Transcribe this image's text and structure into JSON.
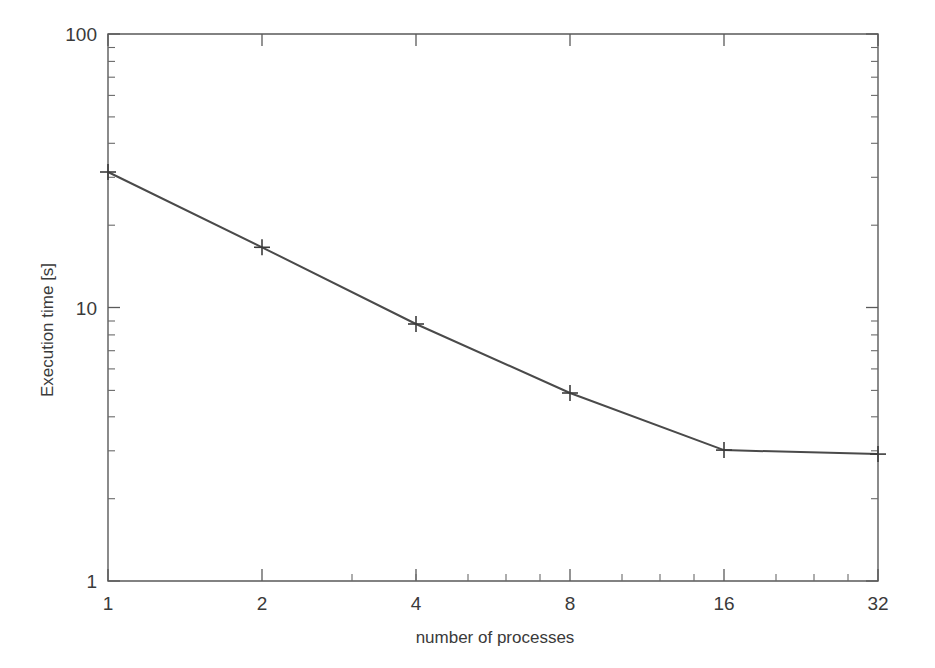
{
  "chart_data": {
    "type": "line",
    "title": "",
    "subtitle": "",
    "xlabel": "number of processes",
    "ylabel": "Execution time [s]",
    "xscale": "log2",
    "yscale": "log10",
    "xlim": [
      1,
      32
    ],
    "ylim": [
      1,
      100
    ],
    "grid": false,
    "legend": null,
    "x_tick_labels": [
      "1",
      "2",
      "4",
      "8",
      "16",
      "32"
    ],
    "x_ticks": [
      1,
      2,
      4,
      8,
      16,
      32
    ],
    "y_tick_labels": [
      "1",
      "10",
      "100"
    ],
    "y_ticks": [
      1,
      10,
      100
    ],
    "marker": "plus",
    "line_color": "#4a4a4a",
    "series": [
      {
        "name": "execution time",
        "x": [
          1,
          2,
          4,
          8,
          16,
          32
        ],
        "values": [
          31.3,
          16.6,
          8.7,
          4.87,
          3.01,
          2.91
        ]
      }
    ],
    "annotations": []
  },
  "axes": {
    "x_axis_title": "number of processes",
    "y_axis_title": "Execution time [s]"
  },
  "y_labels": {
    "top": "100",
    "middle": "10",
    "bottom": "1"
  },
  "x_labels": {
    "t1": "1",
    "t2": "2",
    "t3": "4",
    "t4": "8",
    "t5": "16",
    "t6": "32"
  },
  "colors": {
    "line": "#4a4a4a",
    "frame": "#5a5a5a",
    "text": "#3a3a3a",
    "background": "#ffffff"
  }
}
